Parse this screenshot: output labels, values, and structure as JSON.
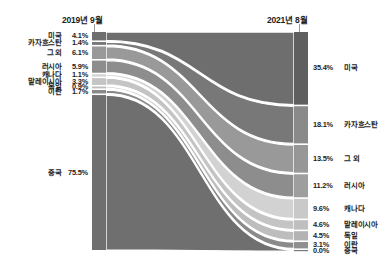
{
  "header": {
    "left_axis_label": "2019년 9월",
    "right_axis_label": "2021년 8월"
  },
  "chart_data": {
    "type": "sankey",
    "title": "",
    "xlabel": "",
    "ylabel": "",
    "left_axis_label": "2019년 9월",
    "right_axis_label": "2021년 8월",
    "unit": "%",
    "nodes_left": [
      {
        "name": "미국",
        "value": 4.1,
        "label": "4.1%",
        "color": "#6e6e6e"
      },
      {
        "name": "카자흐스탄",
        "value": 1.4,
        "label": "1.4%",
        "color": "#787878"
      },
      {
        "name": "그 외",
        "value": 6.1,
        "label": "6.1%",
        "color": "#999999"
      },
      {
        "name": "러시아",
        "value": 5.9,
        "label": "5.9%",
        "color": "#8d8d8d"
      },
      {
        "name": "캐나다",
        "value": 1.1,
        "label": "1.1%",
        "color": "#d2d2d2"
      },
      {
        "name": "말레이시아",
        "value": 3.3,
        "label": "3.3%",
        "color": "#c4c4c4"
      },
      {
        "name": "독일",
        "value": 0.9,
        "label": "0.9%",
        "color": "#bdbdbd"
      },
      {
        "name": "이란",
        "value": 1.7,
        "label": "1.7%",
        "color": "#8a8a8a"
      },
      {
        "name": "중국",
        "value": 75.5,
        "label": "75.5%",
        "color": "#6f6f6f"
      }
    ],
    "nodes_right": [
      {
        "name": "미국",
        "value": 35.4,
        "label": "35.4%",
        "color": "#5f5f5f"
      },
      {
        "name": "카자흐스탄",
        "value": 18.1,
        "label": "18.1%",
        "color": "#8a8a8a"
      },
      {
        "name": "그 외",
        "value": 13.5,
        "label": "13.5%",
        "color": "#979797"
      },
      {
        "name": "러시아",
        "value": 11.2,
        "label": "11.2%",
        "color": "#9e9e9e"
      },
      {
        "name": "캐나다",
        "value": 9.6,
        "label": "9.6%",
        "color": "#c9c9c9"
      },
      {
        "name": "말레이시아",
        "value": 4.6,
        "label": "4.6%",
        "color": "#bfbfbf"
      },
      {
        "name": "독일",
        "value": 4.5,
        "label": "4.5%",
        "color": "#b3b3b3"
      },
      {
        "name": "이란",
        "value": 3.1,
        "label": "3.1%",
        "color": "#8f8f8f"
      },
      {
        "name": "중국",
        "value": 0.0,
        "label": "0.0%",
        "color": "#7a7a7a"
      }
    ],
    "flows": [
      {
        "from": "미국",
        "to": "미국",
        "value": 4.1
      },
      {
        "from": "카자흐스탄",
        "to": "카자흐스탄",
        "value": 1.4
      },
      {
        "from": "그 외",
        "to": "그 외",
        "value": 6.1
      },
      {
        "from": "러시아",
        "to": "러시아",
        "value": 5.9
      },
      {
        "from": "캐나다",
        "to": "캐나다",
        "value": 1.1
      },
      {
        "from": "말레이시아",
        "to": "말레이시아",
        "value": 3.3
      },
      {
        "from": "독일",
        "to": "독일",
        "value": 0.9
      },
      {
        "from": "이란",
        "to": "이란",
        "value": 1.7
      },
      {
        "from": "중국",
        "to": "중국",
        "value": 0.0
      }
    ]
  }
}
